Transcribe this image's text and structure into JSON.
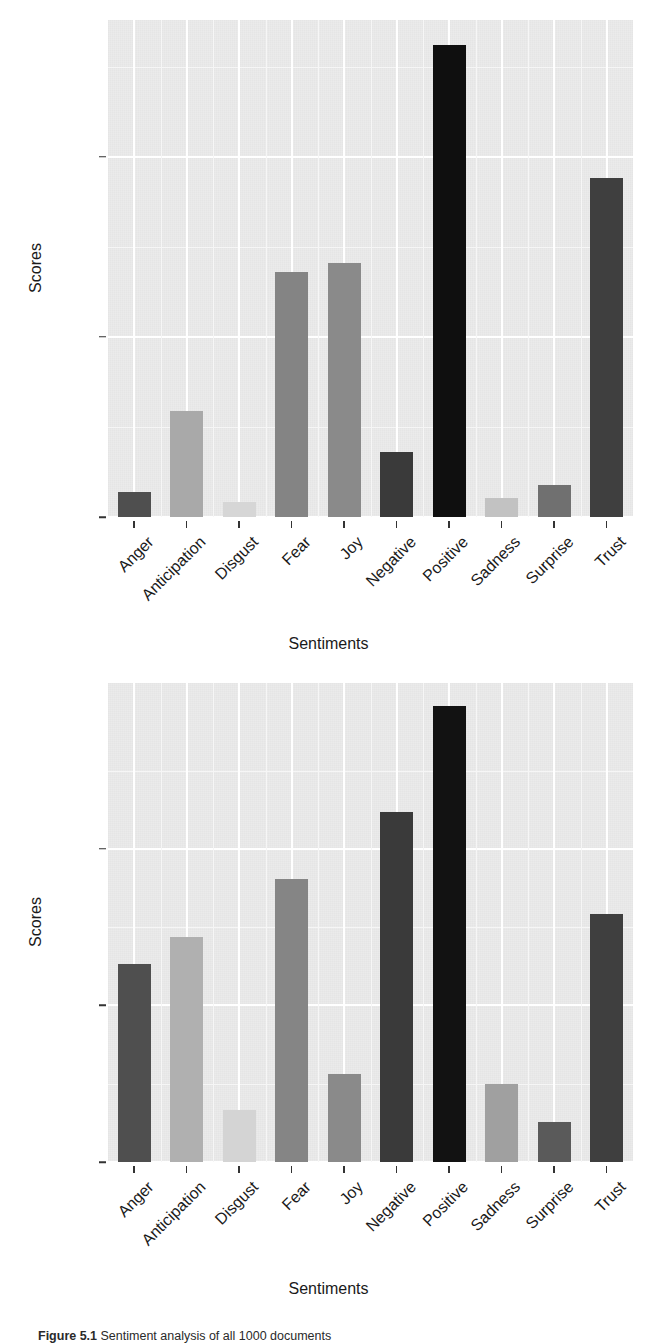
{
  "figure": {
    "caption_prefix": "Figure 5.1",
    "caption_text": "Sentiment analysis of all 1000 documents"
  },
  "charts": [
    {
      "id": "top",
      "name": "sentiment-scores-chart-1",
      "xlabel": "Sentiments",
      "ylabel": "Scores",
      "y_ticks": [
        "0",
        "500",
        "1000"
      ],
      "x_ticks": [
        "Anger",
        "Anticipation",
        "Disgust",
        "Fear",
        "Joy",
        "Negative",
        "Positive",
        "Sadness",
        "Surprise",
        "Trust"
      ]
    },
    {
      "id": "bottom",
      "name": "sentiment-scores-chart-2",
      "xlabel": "Sentiments",
      "ylabel": "Scores",
      "y_ticks": [
        "0",
        "200",
        "400"
      ],
      "x_ticks": [
        "Anger",
        "Anticipation",
        "Disgust",
        "Fear",
        "Joy",
        "Negative",
        "Positive",
        "Sadness",
        "Surprise",
        "Trust"
      ]
    }
  ],
  "chart_data": [
    {
      "type": "bar",
      "id": "top",
      "title": "",
      "xlabel": "Sentiments",
      "ylabel": "Scores",
      "categories": [
        "Anger",
        "Anticipation",
        "Disgust",
        "Fear",
        "Joy",
        "Negative",
        "Positive",
        "Sadness",
        "Surprise",
        "Trust"
      ],
      "values": [
        70,
        295,
        42,
        680,
        705,
        180,
        1310,
        53,
        90,
        940
      ],
      "bar_colors": [
        "#4f4f4f",
        "#a9a9a9",
        "#d6d6d6",
        "#848484",
        "#8a8a8a",
        "#3a3a3a",
        "#0f0f0f",
        "#c2c2c2",
        "#707070",
        "#3f3f3f"
      ],
      "ylim": [
        0,
        1380
      ],
      "ytick_values": [
        0,
        500,
        1000
      ],
      "grid": true,
      "legend": "none"
    },
    {
      "type": "bar",
      "id": "bottom",
      "title": "",
      "xlabel": "Sentiments",
      "ylabel": "Scores",
      "categories": [
        "Anger",
        "Anticipation",
        "Disgust",
        "Fear",
        "Joy",
        "Negative",
        "Positive",
        "Sadness",
        "Surprise",
        "Trust"
      ],
      "values": [
        253,
        287,
        67,
        361,
        112,
        447,
        582,
        100,
        51,
        317
      ],
      "bar_colors": [
        "#4f4f4f",
        "#b0b0b0",
        "#d4d4d4",
        "#858585",
        "#8a8a8a",
        "#3a3a3a",
        "#121212",
        "#a0a0a0",
        "#5a5a5a",
        "#3f3f3f"
      ],
      "ylim": [
        0,
        612
      ],
      "ytick_values": [
        0,
        200,
        400
      ],
      "grid": true,
      "legend": "none"
    }
  ],
  "colors": {
    "panel_background": "#ebebeb",
    "gridline_major": "#ffffff",
    "gridline_minor": "#f6f6f6",
    "text": "#1a1a1a",
    "page_background": "#ffffff"
  }
}
